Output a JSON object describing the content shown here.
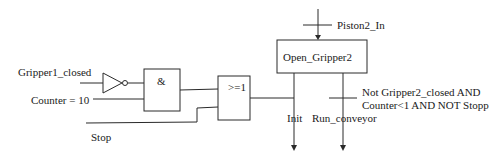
{
  "diagram": {
    "type": "SFC with logic gates",
    "inputs": {
      "gripper1_closed": "Gripper1_closed",
      "counter": "Counter = 10",
      "stop": "Stop"
    },
    "gates": {
      "and_symbol": "&",
      "or_symbol": ">=1",
      "not_gate": "inverter"
    },
    "transition_top": {
      "label": "Piston2_In"
    },
    "step": {
      "label": "Open_Gripper2"
    },
    "outputs": {
      "init": "Init",
      "run_conveyor": "Run_conveyor"
    },
    "transition_condition": {
      "line1": "Not Gripper2_closed AND",
      "line2": "Counter<1 AND NOT Stopp"
    }
  }
}
